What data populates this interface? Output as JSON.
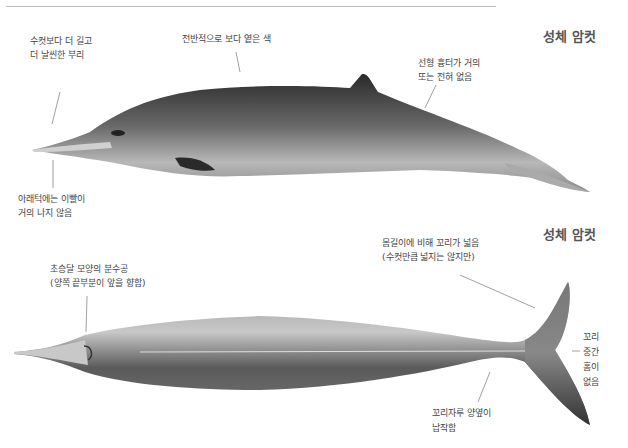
{
  "page": {
    "header_rule": true
  },
  "figure_top": {
    "title": "성체 암컷",
    "annotations": [
      {
        "id": "beak",
        "lines": [
          "수컷보다 더 길고",
          "더 날씬한 부리"
        ]
      },
      {
        "id": "color",
        "lines": [
          "전반적으로 보다 옅은 색"
        ]
      },
      {
        "id": "ridge",
        "lines": [
          "선형 흉터가 거의",
          "또는 전혀 없음"
        ]
      },
      {
        "id": "teeth",
        "lines": [
          "아래턱에는 이빨이",
          "거의 나지 않음"
        ]
      }
    ]
  },
  "figure_bottom": {
    "title": "성체 암컷",
    "annotations": [
      {
        "id": "blowhole",
        "lines": [
          "초승달 모양의 분수공",
          "(양쪽 끝부분이 앞을 향함)"
        ]
      },
      {
        "id": "fluke",
        "lines": [
          "몸길이에 비해 꼬리가 넓음",
          "(수컷만큼 넓지는 않지만)"
        ]
      },
      {
        "id": "notch",
        "lines": [
          "꼬리",
          "중간",
          "홈이",
          "없음"
        ]
      },
      {
        "id": "peduncle",
        "lines": [
          "꼬리자루 양옆이",
          "납작함"
        ]
      }
    ]
  }
}
